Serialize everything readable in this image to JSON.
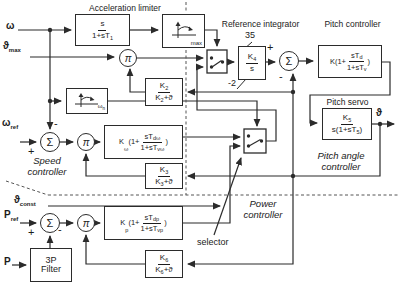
{
  "titles": {
    "acceleration_limiter": "Acceleration limiter",
    "reference_integrator": "Reference integrator",
    "pitch_controller": "Pitch controller",
    "pitch_servo": "Pitch servo"
  },
  "section_labels": {
    "speed_l1": "Speed",
    "speed_l2": "controller",
    "pitch_angle_l1": "Pitch angle",
    "pitch_angle_l2": "controller",
    "power_l1": "Power",
    "power_l2": "controller",
    "selector": "selector"
  },
  "signals": {
    "omega": "ω",
    "theta_max_main": "ϑ",
    "theta_max_sub": "max",
    "omega_ref_main": "ω",
    "omega_ref_sub": "ref",
    "p_ref_main": "P",
    "p_ref_sub": "ref",
    "p_in": "P",
    "theta_const_main": "ϑ",
    "theta_const_sub": "const",
    "theta_out": "ϑ"
  },
  "operators": {
    "sum": "Σ",
    "mult": "π",
    "plus": "+",
    "minus": "-"
  },
  "integrator_limits": {
    "upper": "35",
    "lower": "-2"
  },
  "blocks": {
    "washout": {
      "num": "s",
      "den": "1+sT",
      "den_sub": "1"
    },
    "rate_limiter": {
      "corner": "max"
    },
    "omega_limiter": {
      "corner": "ω",
      "corner_sub": "n"
    },
    "k2": {
      "num": "K",
      "num_sub": "2",
      "den": "K",
      "den_sub": "2",
      "den_post": "+ϑ"
    },
    "k3": {
      "num": "K",
      "num_sub": "3",
      "den": "K",
      "den_sub": "3",
      "den_post": "+ϑ"
    },
    "k6": {
      "num": "K",
      "num_sub": "6",
      "den": "K",
      "den_sub": "6",
      "den_post": "+ϑ"
    },
    "integrator": {
      "num": "K",
      "num_sub": "4",
      "den": "s"
    },
    "pitch_controller": {
      "pre": "K(1+",
      "num": "sT",
      "num_sub": "d",
      "den": "1+sT",
      "den_sub": "v",
      "post": ")"
    },
    "pitch_servo": {
      "num": "K",
      "num_sub": "5",
      "den_pre": "s(1+sT",
      "den_sub": "5",
      "den_post": ")"
    },
    "speed_controller": {
      "pre": "K",
      "pre_sub": "ω",
      "pre2": "(1+",
      "num": "sT",
      "num_sub": "dω",
      "den": "1+sT",
      "den_sub": "vω",
      "post": ")"
    },
    "power_controller": {
      "pre": "K",
      "pre_sub": "p",
      "pre2": "(1+",
      "num": "sT",
      "num_sub": "dp",
      "den": "1+sT",
      "den_sub": "vp",
      "post": ")"
    },
    "filter_3p": {
      "l1": "3P",
      "l2": "Filter"
    }
  }
}
